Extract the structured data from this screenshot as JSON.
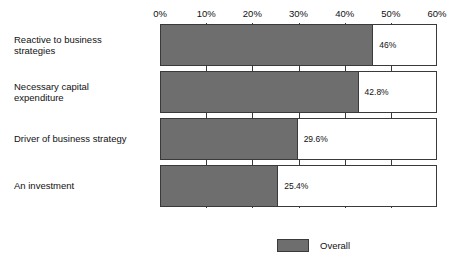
{
  "chart_data": {
    "type": "bar",
    "orientation": "horizontal",
    "title": "",
    "subtitle": "",
    "xlabel": "",
    "ylabel": "",
    "xlim": [
      0,
      60
    ],
    "xtick_labels": [
      "0%",
      "10%",
      "20%",
      "30%",
      "40%",
      "50%",
      "60%"
    ],
    "xtick_values": [
      0,
      10,
      20,
      30,
      40,
      50,
      60
    ],
    "grid": true,
    "legend_position": "bottom",
    "categories": [
      "Reactive to business strategies",
      "Necessary capital expenditure",
      "Driver of business strategy",
      "An investment"
    ],
    "series": [
      {
        "name": "Overall",
        "color": "#6e6e6e",
        "values": [
          46,
          42.8,
          29.6,
          25.4
        ],
        "value_labels": [
          "46%",
          "42.8%",
          "29.6%",
          "25.4%"
        ]
      }
    ]
  },
  "category_label_lines": [
    [
      "Reactive to business",
      "strategies"
    ],
    [
      "Necessary capital",
      "expenditure"
    ],
    [
      "Driver of business strategy"
    ],
    [
      "An investment"
    ]
  ],
  "legend": {
    "items": [
      {
        "label": "Overall",
        "color": "#6e6e6e"
      }
    ]
  },
  "colors": {
    "bar_fill": "#6e6e6e",
    "bar_outline": "#3a3a3a",
    "background": "#ffffff",
    "text": "#111111"
  }
}
